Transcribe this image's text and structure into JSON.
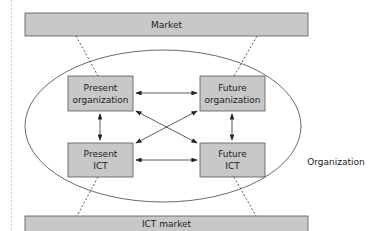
{
  "diagram": {
    "market_label": "Market",
    "ict_market_label": "ICT market",
    "organization_label": "Organization",
    "boxes": {
      "present_org": [
        "Present",
        "organization"
      ],
      "future_org": [
        "Future",
        "organization"
      ],
      "present_ict": [
        "Present",
        "ICT"
      ],
      "future_ict": [
        "Future",
        "ICT"
      ]
    },
    "colors": {
      "box_fill": "#c8c8c8",
      "box_stroke": "#555555",
      "line": "#333333"
    }
  }
}
